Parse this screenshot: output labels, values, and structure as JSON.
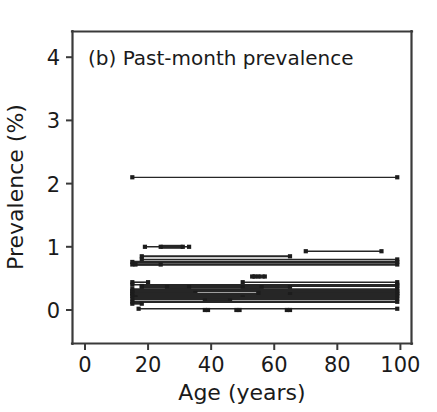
{
  "chart_data": {
    "type": "line",
    "title": "(b) Past-month prevalence",
    "xlabel": "Age (years)",
    "ylabel": "Prevalence (%)",
    "xlim": [
      -4,
      104
    ],
    "ylim": [
      -0.45,
      4.55
    ],
    "xticks": [
      0,
      20,
      40,
      60,
      80,
      100
    ],
    "xtick_labels": [
      "0",
      "20",
      "40",
      "60",
      "80",
      "100"
    ],
    "yticks": [
      0,
      1,
      2,
      3,
      4
    ],
    "ytick_labels": [
      "0",
      "1",
      "2",
      "3",
      "4"
    ],
    "grid": false,
    "legend": null,
    "marker": "square",
    "series_description": "Each horizontal segment is one study's reported past-month prevalence plotted across its sampled age range; square markers denote the age-range endpoints.",
    "series": [
      {
        "name": "s01",
        "value": 2.1,
        "x_start": 15,
        "x_end": 99,
        "values": [
          2.1,
          2.1
        ],
        "x": [
          15,
          99
        ],
        "linewidth": 1.2
      },
      {
        "name": "s02",
        "value": 1.0,
        "x_start": 19,
        "x_end": 33,
        "values": [
          1.0,
          1.0
        ],
        "x": [
          19,
          33
        ],
        "linewidth": 1.6
      },
      {
        "name": "s03",
        "value": 1.0,
        "x_start": 24,
        "x_end": 31,
        "values": [
          1.0,
          1.0
        ],
        "x": [
          24,
          31
        ],
        "linewidth": 4.0
      },
      {
        "name": "s04",
        "value": 0.93,
        "x_start": 70,
        "x_end": 94,
        "values": [
          0.93,
          0.93
        ],
        "x": [
          70,
          94
        ],
        "linewidth": 1.6
      },
      {
        "name": "s05",
        "value": 0.85,
        "x_start": 18,
        "x_end": 65,
        "values": [
          0.85,
          0.85
        ],
        "x": [
          18,
          65
        ],
        "linewidth": 2.0
      },
      {
        "name": "s06",
        "value": 0.8,
        "x_start": 18,
        "x_end": 99,
        "values": [
          0.8,
          0.8
        ],
        "x": [
          18,
          99
        ],
        "linewidth": 1.4
      },
      {
        "name": "s07",
        "value": 0.76,
        "x_start": 15,
        "x_end": 99,
        "values": [
          0.76,
          0.76
        ],
        "x": [
          15,
          99
        ],
        "linewidth": 2.2
      },
      {
        "name": "s08",
        "value": 0.72,
        "x_start": 15,
        "x_end": 99,
        "values": [
          0.72,
          0.72
        ],
        "x": [
          15,
          99
        ],
        "linewidth": 2.6
      },
      {
        "name": "s09",
        "value": 0.72,
        "x_start": 16,
        "x_end": 24,
        "values": [
          0.72,
          0.72
        ],
        "x": [
          16,
          24
        ],
        "linewidth": 2.0
      },
      {
        "name": "s10",
        "value": 0.53,
        "x_start": 53,
        "x_end": 54,
        "values": [
          0.53,
          0.53
        ],
        "x": [
          53,
          54
        ],
        "linewidth": 4.0
      },
      {
        "name": "s11",
        "value": 0.53,
        "x_start": 55,
        "x_end": 57,
        "values": [
          0.53,
          0.53
        ],
        "x": [
          55,
          57
        ],
        "linewidth": 4.0
      },
      {
        "name": "s12",
        "value": 0.44,
        "x_start": 15,
        "x_end": 20,
        "values": [
          0.44,
          0.44
        ],
        "x": [
          15,
          20
        ],
        "linewidth": 1.6
      },
      {
        "name": "s13",
        "value": 0.44,
        "x_start": 50,
        "x_end": 99,
        "values": [
          0.44,
          0.44
        ],
        "x": [
          50,
          99
        ],
        "linewidth": 1.4
      },
      {
        "name": "s14",
        "value": 0.4,
        "x_start": 15,
        "x_end": 99,
        "values": [
          0.4,
          0.4
        ],
        "x": [
          15,
          99
        ],
        "linewidth": 1.6
      },
      {
        "name": "s15",
        "value": 0.38,
        "x_start": 18,
        "x_end": 99,
        "values": [
          0.38,
          0.38
        ],
        "x": [
          18,
          99
        ],
        "linewidth": 2.2
      },
      {
        "name": "s16",
        "value": 0.36,
        "x_start": 18,
        "x_end": 65,
        "values": [
          0.36,
          0.36
        ],
        "x": [
          18,
          65
        ],
        "linewidth": 2.6
      },
      {
        "name": "s17",
        "value": 0.36,
        "x_start": 26,
        "x_end": 33,
        "values": [
          0.36,
          0.36
        ],
        "x": [
          26,
          33
        ],
        "linewidth": 4.5
      },
      {
        "name": "s18",
        "value": 0.36,
        "x_start": 50,
        "x_end": 56,
        "values": [
          0.36,
          0.36
        ],
        "x": [
          50,
          56
        ],
        "linewidth": 4.5
      },
      {
        "name": "s19",
        "value": 0.33,
        "x_start": 15,
        "x_end": 99,
        "values": [
          0.33,
          0.33
        ],
        "x": [
          15,
          99
        ],
        "linewidth": 1.8
      },
      {
        "name": "s20",
        "value": 0.3,
        "x_start": 15,
        "x_end": 99,
        "values": [
          0.3,
          0.3
        ],
        "x": [
          15,
          99
        ],
        "linewidth": 2.4
      },
      {
        "name": "s21",
        "value": 0.27,
        "x_start": 15,
        "x_end": 35,
        "values": [
          0.27,
          0.27
        ],
        "x": [
          15,
          35
        ],
        "linewidth": 2.0
      },
      {
        "name": "s22",
        "value": 0.27,
        "x_start": 55,
        "x_end": 99,
        "values": [
          0.27,
          0.27
        ],
        "x": [
          55,
          99
        ],
        "linewidth": 2.0
      },
      {
        "name": "s23",
        "value": 0.25,
        "x_start": 15,
        "x_end": 99,
        "values": [
          0.25,
          0.25
        ],
        "x": [
          15,
          99
        ],
        "linewidth": 3.0
      },
      {
        "name": "s24",
        "value": 0.25,
        "x_start": 55,
        "x_end": 65,
        "values": [
          0.25,
          0.25
        ],
        "x": [
          55,
          65
        ],
        "linewidth": 4.5
      },
      {
        "name": "s25",
        "value": 0.22,
        "x_start": 15,
        "x_end": 99,
        "values": [
          0.22,
          0.22
        ],
        "x": [
          15,
          99
        ],
        "linewidth": 2.0
      },
      {
        "name": "s26",
        "value": 0.2,
        "x_start": 16,
        "x_end": 50,
        "values": [
          0.2,
          0.2
        ],
        "x": [
          16,
          50
        ],
        "linewidth": 2.6
      },
      {
        "name": "s27",
        "value": 0.18,
        "x_start": 15,
        "x_end": 99,
        "values": [
          0.18,
          0.18
        ],
        "x": [
          15,
          99
        ],
        "linewidth": 3.4
      },
      {
        "name": "s28",
        "value": 0.15,
        "x_start": 38,
        "x_end": 46,
        "values": [
          0.15,
          0.15
        ],
        "x": [
          38,
          46
        ],
        "linewidth": 4.5
      },
      {
        "name": "s29",
        "value": 0.13,
        "x_start": 15,
        "x_end": 99,
        "values": [
          0.13,
          0.13
        ],
        "x": [
          15,
          99
        ],
        "linewidth": 2.2
      },
      {
        "name": "s30",
        "value": 0.1,
        "x_start": 15,
        "x_end": 18,
        "values": [
          0.1,
          0.1
        ],
        "x": [
          15,
          18
        ],
        "linewidth": 2.0
      },
      {
        "name": "s31",
        "value": 0.02,
        "x_start": 17,
        "x_end": 99,
        "values": [
          0.02,
          0.02
        ],
        "x": [
          17,
          99
        ],
        "linewidth": 1.6
      },
      {
        "name": "s32",
        "value": 0.0,
        "x_start": 38,
        "x_end": 39,
        "values": [
          0.0,
          0.0
        ],
        "x": [
          38,
          39
        ],
        "linewidth": 4.0
      },
      {
        "name": "s33",
        "value": 0.0,
        "x_start": 48,
        "x_end": 49,
        "values": [
          0.0,
          0.0
        ],
        "x": [
          48,
          49
        ],
        "linewidth": 4.0
      },
      {
        "name": "s34",
        "value": 0.0,
        "x_start": 64,
        "x_end": 65,
        "values": [
          0.0,
          0.0
        ],
        "x": [
          64,
          65
        ],
        "linewidth": 4.0
      }
    ]
  }
}
